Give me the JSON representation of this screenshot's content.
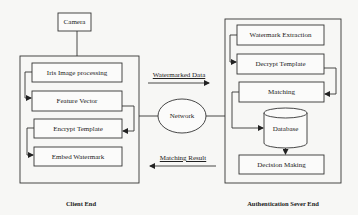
{
  "diagram": {
    "type": "block-diagram",
    "background_text": "...",
    "nodes": {
      "camera": "Camera",
      "client": {
        "iris": "Iris Image processing",
        "feature": "Feature Vector",
        "encrypt": "Encrypt Template",
        "embed": "Embed Watermark",
        "caption": "Client End"
      },
      "network": "Network",
      "server": {
        "extraction": "Watermark Extraction",
        "decrypt": "Decrypt Template",
        "matching": "Matching",
        "database": "Database",
        "decision": "Decision Making",
        "caption": "Authentication Sever End"
      }
    },
    "edges": {
      "to_server": "Watermarked Data",
      "to_client": "Matching Result"
    },
    "edge_list": [
      {
        "from": "Camera",
        "to": "Client End"
      },
      {
        "from": "Iris Image processing",
        "to": "Feature Vector"
      },
      {
        "from": "Feature Vector",
        "to": "Encrypt Template"
      },
      {
        "from": "Encrypt Template",
        "to": "Embed Watermark"
      },
      {
        "from": "Client End",
        "to": "Network"
      },
      {
        "from": "Network",
        "to": "Authentication Sever End"
      },
      {
        "from": "Client End",
        "to": "Authentication Sever End",
        "label": "Watermarked Data"
      },
      {
        "from": "Watermark Extraction",
        "to": "Decrypt Template"
      },
      {
        "from": "Decrypt Template",
        "to": "Matching"
      },
      {
        "from": "Matching",
        "to": "Database"
      },
      {
        "from": "Database",
        "to": "Decision Making"
      },
      {
        "from": "Authentication Sever End",
        "to": "Client End",
        "label": "Matching Result"
      }
    ]
  }
}
